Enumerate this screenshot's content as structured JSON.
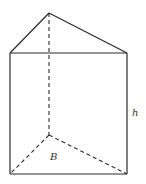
{
  "diagram": {
    "type": "triangular-prism",
    "labels": {
      "height": "h",
      "base": "B"
    },
    "vertices": {
      "top_apex": [
        49,
        13
      ],
      "top_left": [
        10,
        53
      ],
      "top_right": [
        127,
        53
      ],
      "bottom_back": [
        49,
        135
      ],
      "bottom_left": [
        10,
        174
      ],
      "bottom_right": [
        127,
        174
      ]
    },
    "colors": {
      "stroke": "#2a2a2a",
      "background": "#ffffff"
    }
  }
}
